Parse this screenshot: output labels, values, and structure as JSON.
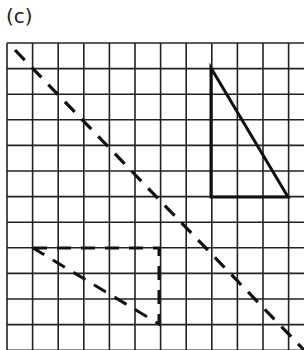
{
  "figure": {
    "label": "(c)",
    "grid": {
      "x0": 7,
      "y0": 43,
      "cell": 25.6,
      "cols": 12,
      "rows": 12,
      "line_color": "#222222"
    },
    "mirror_line": {
      "style": "dashed",
      "from": [
        15,
        50
      ],
      "to": [
        304,
        350
      ]
    },
    "object_triangle": {
      "style": "solid",
      "points": [
        [
          211,
          68
        ],
        [
          211,
          197
        ],
        [
          288,
          197
        ]
      ]
    },
    "image_triangle": {
      "style": "dashed",
      "points": [
        [
          33,
          248
        ],
        [
          159,
          248
        ],
        [
          159,
          324
        ]
      ]
    }
  }
}
